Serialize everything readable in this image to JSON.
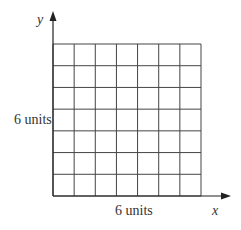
{
  "diagram": {
    "grid": {
      "rows": 7,
      "cols": 7,
      "left": 53,
      "top": 44,
      "right": 201,
      "bottom": 196,
      "line_color": "#444444"
    },
    "axes": {
      "x_label": "x",
      "y_label": "y",
      "color": "#222222"
    },
    "labels": {
      "height": "6 units",
      "width": "6 units"
    }
  }
}
